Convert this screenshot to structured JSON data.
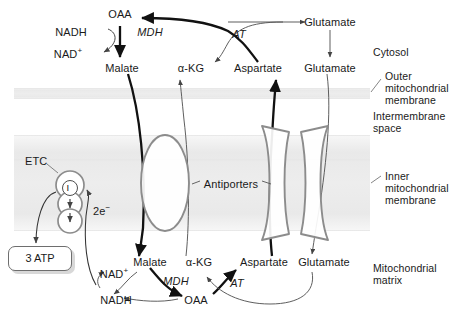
{
  "diagram": {
    "colors": {
      "membrane_band": "#ebebeb",
      "membrane_band_edge": "#f6f6f6",
      "protein_outline": "#8c8c8c",
      "thick_arrow": "#111111",
      "thin_arrow": "#555555",
      "text": "#1a1a1a",
      "atp_box_border": "#6e6e6e",
      "atp_box_shadow": "#d8d8d8"
    }
  },
  "compartments": [
    {
      "name": "cytosol",
      "label": "Cytosol"
    },
    {
      "name": "outer-membrane",
      "label": "Outer\nmitochondrial\nmembrane"
    },
    {
      "name": "intermembrane-space",
      "label": "Intermembrane\nspace"
    },
    {
      "name": "inner-membrane",
      "label": "Inner\nmitochondrial\nmembrane"
    },
    {
      "name": "matrix",
      "label": "Mitochondrial\nmatrix"
    }
  ],
  "compartment_labels": {
    "cytosol": "Cytosol",
    "outer_membrane_l1": "Outer",
    "outer_membrane_l2": "mitochondrial",
    "outer_membrane_l3": "membrane",
    "intermembrane_l1": "Intermembrane",
    "intermembrane_l2": "space",
    "inner_membrane_l1": "Inner",
    "inner_membrane_l2": "mitochondrial",
    "inner_membrane_l3": "membrane",
    "matrix_l1": "Mitochondrial",
    "matrix_l2": "matrix"
  },
  "cytosol": {
    "metabolites": {
      "oaa": "OAA",
      "malate": "Malate",
      "akg": "α-KG",
      "aspartate": "Aspartate",
      "glutamate_top": "Glutamate",
      "glutamate_lower": "Glutamate"
    },
    "cofactors": {
      "nadh": "NADH",
      "nad_plus": "NAD",
      "nad_plus_charge": "+"
    },
    "enzymes": {
      "mdh": "MDH",
      "at": "AT"
    }
  },
  "matrix": {
    "metabolites": {
      "malate": "Malate",
      "akg": "α-KG",
      "aspartate": "Aspartate",
      "glutamate": "Glutamate",
      "oaa": "OAA"
    },
    "cofactors": {
      "nad_plus": "NAD",
      "nad_plus_charge": "+",
      "nadh": "NADH"
    },
    "enzymes": {
      "mdh": "MDH",
      "at": "AT"
    }
  },
  "etc": {
    "label": "ETC",
    "complex_one": "I",
    "electrons": "2e",
    "electrons_charge": "−",
    "atp_yield": "3 ATP"
  },
  "transporters": {
    "label": "Antiporters",
    "items": [
      {
        "name": "malate-alpha-ketoglutarate-antiporter",
        "shape": "ellipse"
      },
      {
        "name": "aspartate-glutamate-antiporter",
        "shape": "hourglass"
      }
    ]
  }
}
